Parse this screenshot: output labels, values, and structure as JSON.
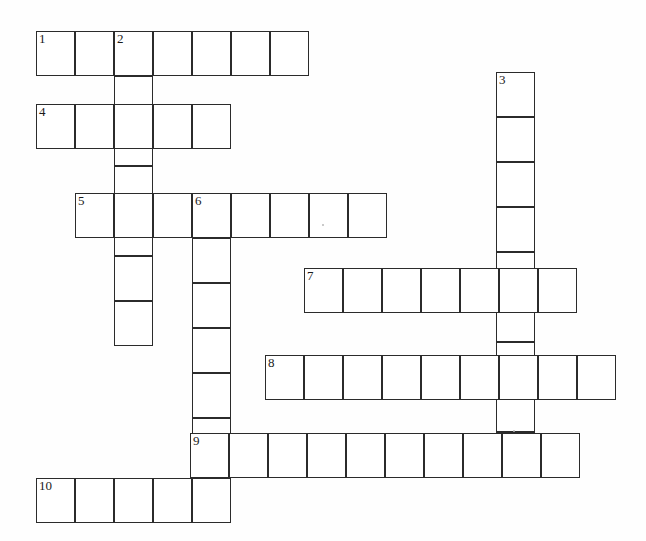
{
  "puzzle": {
    "title": "Crossword Puzzle Grid",
    "background_color": "#fefefe",
    "cell_border_color": "#2b2b2b",
    "cell_fill_color": "#ffffff",
    "number_color": "#1a1a1a",
    "cell_width": 39,
    "cell_height": 45,
    "origin_x": 36,
    "origin_y": 31,
    "canvas_width": 646,
    "canvas_height": 541,
    "entries": [
      {
        "number": "1",
        "direction": "across",
        "length": 7,
        "x": 36,
        "y": 31,
        "cells": [
          "",
          "",
          "",
          "",
          "",
          "",
          ""
        ]
      },
      {
        "number": "2",
        "direction": "down",
        "length": 7,
        "x": 114,
        "y": 31,
        "cells": [
          "",
          "",
          "",
          "",
          "",
          "",
          ""
        ]
      },
      {
        "number": "3",
        "direction": "down",
        "length": 9,
        "x": 496,
        "y": 72,
        "cells": [
          "",
          "",
          "",
          "",
          "",
          "",
          "",
          "",
          ""
        ]
      },
      {
        "number": "4",
        "direction": "across",
        "length": 5,
        "x": 36,
        "y": 104,
        "cells": [
          "",
          "",
          "",
          "",
          ""
        ]
      },
      {
        "number": "5",
        "direction": "across",
        "length": 8,
        "x": 75,
        "y": 193,
        "cells": [
          "",
          "",
          "",
          "",
          "",
          "",
          "",
          ""
        ]
      },
      {
        "number": "6",
        "direction": "down",
        "length": 7,
        "x": 192,
        "y": 193,
        "cells": [
          "",
          "",
          "",
          "",
          "",
          "",
          ""
        ]
      },
      {
        "number": "7",
        "direction": "across",
        "length": 7,
        "x": 304,
        "y": 268,
        "cells": [
          "",
          "",
          "",
          "",
          "",
          "",
          ""
        ]
      },
      {
        "number": "8",
        "direction": "across",
        "length": 9,
        "x": 265,
        "y": 355,
        "cells": [
          "",
          "",
          "",
          "",
          "",
          "",
          "",
          "",
          ""
        ]
      },
      {
        "number": "9",
        "direction": "across",
        "length": 10,
        "x": 190,
        "y": 433,
        "cells": [
          "",
          "",
          "",
          "",
          "",
          "",
          "",
          "",
          "",
          ""
        ]
      },
      {
        "number": "10",
        "direction": "across",
        "length": 5,
        "x": 36,
        "y": 478,
        "cells": [
          "",
          "",
          "",
          "",
          ""
        ]
      }
    ],
    "specks": [
      {
        "x": 322,
        "y": 224
      },
      {
        "x": 513,
        "y": 430
      }
    ]
  }
}
